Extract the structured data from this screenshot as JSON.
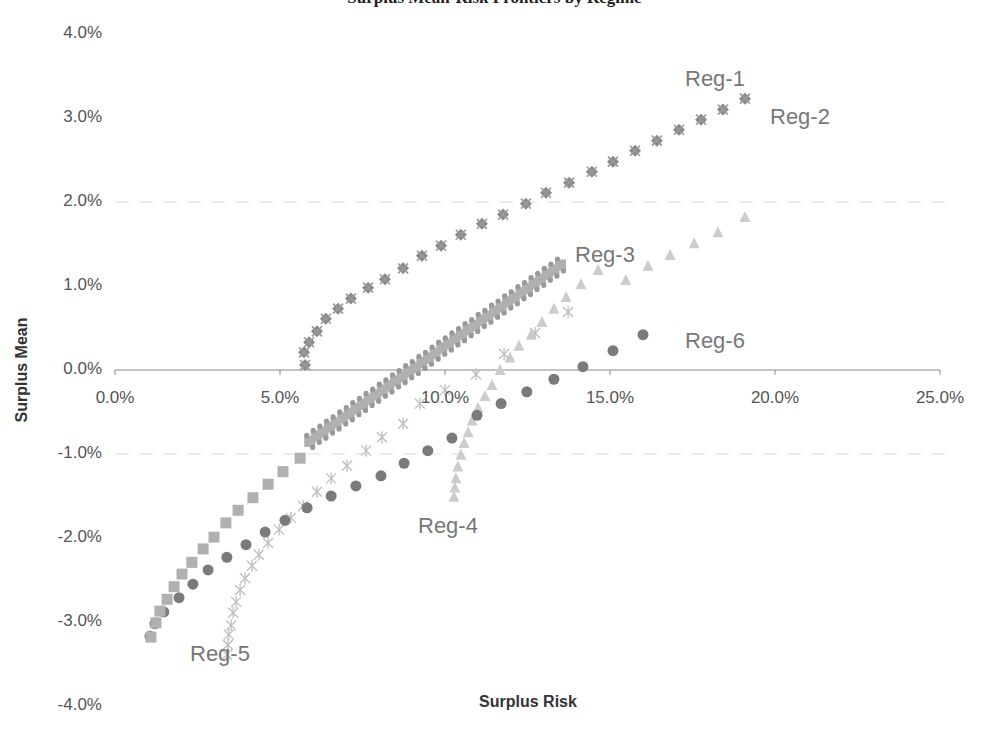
{
  "chart_data": {
    "type": "scatter",
    "title": "Surplus Mean-Risk Frontiers by Regime",
    "xlabel": "Surplus Risk",
    "ylabel": "Surplus Mean",
    "xlim": [
      0,
      25
    ],
    "ylim": [
      -4,
      4
    ],
    "x_ticks": [
      "0.0%",
      "5.0%",
      "10.0%",
      "15.0%",
      "20.0%",
      "25.0%"
    ],
    "y_ticks": [
      "4.0%",
      "3.0%",
      "2.0%",
      "1.0%",
      "0.0%",
      "-1.0%",
      "-2.0%",
      "-3.0%",
      "-4.0%"
    ],
    "grid": "faint horizontal dashed",
    "legend": "inline labels",
    "series": [
      {
        "name": "Reg-1",
        "marker": "diamond",
        "color": "#8a8a8a",
        "points": [
          [
            5.76,
            0.06
          ],
          [
            5.73,
            0.21
          ],
          [
            5.88,
            0.33
          ],
          [
            6.12,
            0.46
          ],
          [
            6.39,
            0.61
          ],
          [
            6.76,
            0.73
          ],
          [
            7.15,
            0.85
          ],
          [
            7.67,
            0.98
          ],
          [
            8.18,
            1.08
          ],
          [
            8.73,
            1.21
          ],
          [
            9.3,
            1.36
          ],
          [
            9.88,
            1.48
          ],
          [
            10.48,
            1.61
          ],
          [
            11.12,
            1.74
          ],
          [
            11.76,
            1.85
          ],
          [
            12.45,
            1.98
          ],
          [
            13.06,
            2.11
          ],
          [
            13.76,
            2.23
          ],
          [
            14.45,
            2.36
          ],
          [
            15.09,
            2.48
          ],
          [
            15.76,
            2.61
          ],
          [
            16.42,
            2.73
          ],
          [
            17.09,
            2.86
          ],
          [
            17.76,
            2.98
          ],
          [
            18.42,
            3.1
          ],
          [
            19.09,
            3.23
          ]
        ]
      },
      {
        "name": "Reg-2",
        "marker": "x",
        "color": "#9a9a9a",
        "points": [
          [
            5.76,
            0.06
          ],
          [
            5.73,
            0.21
          ],
          [
            5.88,
            0.33
          ],
          [
            6.12,
            0.46
          ],
          [
            6.39,
            0.61
          ],
          [
            6.76,
            0.73
          ],
          [
            7.15,
            0.85
          ],
          [
            7.67,
            0.98
          ],
          [
            8.18,
            1.08
          ],
          [
            8.73,
            1.21
          ],
          [
            9.3,
            1.36
          ],
          [
            9.88,
            1.48
          ],
          [
            10.48,
            1.61
          ],
          [
            11.12,
            1.74
          ],
          [
            11.76,
            1.85
          ],
          [
            12.45,
            1.98
          ],
          [
            13.06,
            2.11
          ],
          [
            13.76,
            2.23
          ],
          [
            14.45,
            2.36
          ],
          [
            15.09,
            2.48
          ],
          [
            15.76,
            2.61
          ],
          [
            16.42,
            2.73
          ],
          [
            17.09,
            2.86
          ],
          [
            17.76,
            2.98
          ],
          [
            18.42,
            3.1
          ],
          [
            19.09,
            3.23
          ]
        ]
      },
      {
        "name": "Reg-3",
        "marker": "square",
        "color": "#b0b0b0",
        "points": [
          [
            1.09,
            -3.18
          ],
          [
            1.24,
            -3.01
          ],
          [
            1.36,
            -2.87
          ],
          [
            1.58,
            -2.73
          ],
          [
            1.79,
            -2.58
          ],
          [
            2.03,
            -2.43
          ],
          [
            2.33,
            -2.29
          ],
          [
            2.67,
            -2.13
          ],
          [
            3.0,
            -1.99
          ],
          [
            3.36,
            -1.82
          ],
          [
            3.73,
            -1.67
          ],
          [
            4.18,
            -1.52
          ],
          [
            4.64,
            -1.36
          ],
          [
            5.09,
            -1.21
          ],
          [
            5.61,
            -1.05
          ],
          [
            5.9,
            -0.85
          ],
          [
            6.1,
            -0.79
          ],
          [
            6.3,
            -0.74
          ],
          [
            6.5,
            -0.68
          ],
          [
            6.7,
            -0.63
          ],
          [
            6.9,
            -0.57
          ],
          [
            7.1,
            -0.52
          ],
          [
            7.3,
            -0.46
          ],
          [
            7.5,
            -0.41
          ],
          [
            7.7,
            -0.35
          ],
          [
            7.9,
            -0.3
          ],
          [
            8.1,
            -0.24
          ],
          [
            8.3,
            -0.19
          ],
          [
            8.5,
            -0.13
          ],
          [
            8.7,
            -0.08
          ],
          [
            8.9,
            -0.02
          ],
          [
            9.1,
            0.03
          ],
          [
            9.3,
            0.09
          ],
          [
            9.5,
            0.14
          ],
          [
            9.7,
            0.2
          ],
          [
            9.9,
            0.26
          ],
          [
            10.1,
            0.31
          ],
          [
            10.3,
            0.37
          ],
          [
            10.5,
            0.42
          ],
          [
            10.7,
            0.48
          ],
          [
            10.9,
            0.53
          ],
          [
            11.1,
            0.59
          ],
          [
            11.3,
            0.64
          ],
          [
            11.5,
            0.7
          ],
          [
            11.7,
            0.75
          ],
          [
            11.9,
            0.81
          ],
          [
            12.1,
            0.86
          ],
          [
            12.3,
            0.92
          ],
          [
            12.5,
            0.97
          ],
          [
            12.7,
            1.03
          ],
          [
            12.9,
            1.08
          ],
          [
            13.1,
            1.14
          ],
          [
            13.3,
            1.19
          ],
          [
            13.5,
            1.25
          ]
        ]
      },
      {
        "name": "Reg-4",
        "marker": "triangle",
        "color": "#cccccc",
        "points": [
          [
            10.27,
            -1.51
          ],
          [
            10.3,
            -1.4
          ],
          [
            10.33,
            -1.29
          ],
          [
            10.39,
            -1.15
          ],
          [
            10.48,
            -1.01
          ],
          [
            10.58,
            -0.87
          ],
          [
            10.7,
            -0.74
          ],
          [
            10.82,
            -0.6
          ],
          [
            11.0,
            -0.45
          ],
          [
            11.21,
            -0.31
          ],
          [
            11.42,
            -0.18
          ],
          [
            11.67,
            0.0
          ],
          [
            11.97,
            0.15
          ],
          [
            12.24,
            0.29
          ],
          [
            12.61,
            0.42
          ],
          [
            12.94,
            0.57
          ],
          [
            13.3,
            0.73
          ],
          [
            13.67,
            0.87
          ],
          [
            14.12,
            1.02
          ],
          [
            14.64,
            1.19
          ],
          [
            15.48,
            1.07
          ],
          [
            16.15,
            1.24
          ],
          [
            16.82,
            1.37
          ],
          [
            17.55,
            1.51
          ],
          [
            18.27,
            1.64
          ],
          [
            19.09,
            1.82
          ]
        ]
      },
      {
        "name": "Reg-5",
        "marker": "asterisk",
        "color": "#bdbdbd",
        "points": [
          [
            3.39,
            -3.39
          ],
          [
            3.42,
            -3.27
          ],
          [
            3.45,
            -3.15
          ],
          [
            3.52,
            -3.04
          ],
          [
            3.58,
            -2.89
          ],
          [
            3.67,
            -2.76
          ],
          [
            3.79,
            -2.62
          ],
          [
            3.94,
            -2.48
          ],
          [
            4.15,
            -2.33
          ],
          [
            4.36,
            -2.2
          ],
          [
            4.64,
            -2.06
          ],
          [
            4.97,
            -1.9
          ],
          [
            5.33,
            -1.76
          ],
          [
            5.7,
            -1.62
          ],
          [
            6.12,
            -1.45
          ],
          [
            6.55,
            -1.29
          ],
          [
            7.03,
            -1.14
          ],
          [
            7.61,
            -0.96
          ],
          [
            8.09,
            -0.8
          ],
          [
            8.73,
            -0.64
          ],
          [
            9.24,
            -0.4
          ],
          [
            10.0,
            -0.24
          ],
          [
            10.94,
            -0.05
          ],
          [
            11.79,
            0.19
          ],
          [
            12.73,
            0.44
          ],
          [
            13.73,
            0.69
          ]
        ]
      },
      {
        "name": "Reg-6",
        "marker": "circle",
        "color": "#7a7a7a",
        "points": [
          [
            1.06,
            -3.17
          ],
          [
            1.21,
            -3.02
          ],
          [
            1.48,
            -2.88
          ],
          [
            1.94,
            -2.71
          ],
          [
            2.36,
            -2.55
          ],
          [
            2.82,
            -2.38
          ],
          [
            3.39,
            -2.23
          ],
          [
            3.97,
            -2.08
          ],
          [
            4.55,
            -1.93
          ],
          [
            5.15,
            -1.79
          ],
          [
            5.82,
            -1.64
          ],
          [
            6.55,
            -1.5
          ],
          [
            7.3,
            -1.38
          ],
          [
            8.06,
            -1.26
          ],
          [
            8.76,
            -1.11
          ],
          [
            9.48,
            -0.96
          ],
          [
            10.21,
            -0.81
          ],
          [
            10.97,
            -0.54
          ],
          [
            11.7,
            -0.4
          ],
          [
            12.48,
            -0.26
          ],
          [
            13.3,
            -0.11
          ],
          [
            14.18,
            0.04
          ],
          [
            15.09,
            0.23
          ],
          [
            16.0,
            0.42
          ]
        ]
      }
    ],
    "annotations": [
      {
        "text": "Reg-1",
        "x": 685,
        "y": 66
      },
      {
        "text": "Reg-2",
        "x": 770,
        "y": 104
      },
      {
        "text": "Reg-3",
        "x": 575,
        "y": 242
      },
      {
        "text": "Reg-4",
        "x": 418,
        "y": 513
      },
      {
        "text": "Reg-5",
        "x": 190,
        "y": 641
      },
      {
        "text": "Reg-6",
        "x": 685,
        "y": 328
      }
    ]
  },
  "labels": {
    "title": "Surplus Mean-Risk Frontiers by Regime",
    "xlabel": "Surplus Risk",
    "ylabel": "Surplus Mean",
    "reg1": "Reg-1",
    "reg2": "Reg-2",
    "reg3": "Reg-3",
    "reg4": "Reg-4",
    "reg5": "Reg-5",
    "reg6": "Reg-6"
  }
}
